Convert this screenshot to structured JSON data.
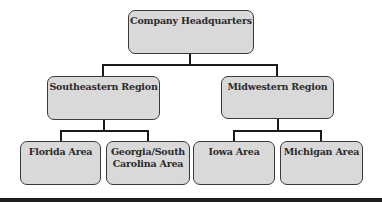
{
  "diagram": {
    "type": "org-chart",
    "colors": {
      "node_fill": "#d9d9d9",
      "node_border": "#3a3a3a",
      "connector": "#1a1a1a",
      "text": "#2a2a2a"
    },
    "root": {
      "label": "Company Headquarters"
    },
    "regions": [
      {
        "label": "Southeastern Region",
        "areas": [
          {
            "label": "Florida Area"
          },
          {
            "label": "Georgia/South Carolina Area",
            "line1": "Georgia/South",
            "line2": "Carolina Area"
          }
        ]
      },
      {
        "label": "Midwestern Region",
        "areas": [
          {
            "label": "Iowa Area"
          },
          {
            "label": "Michigan Area"
          }
        ]
      }
    ]
  }
}
